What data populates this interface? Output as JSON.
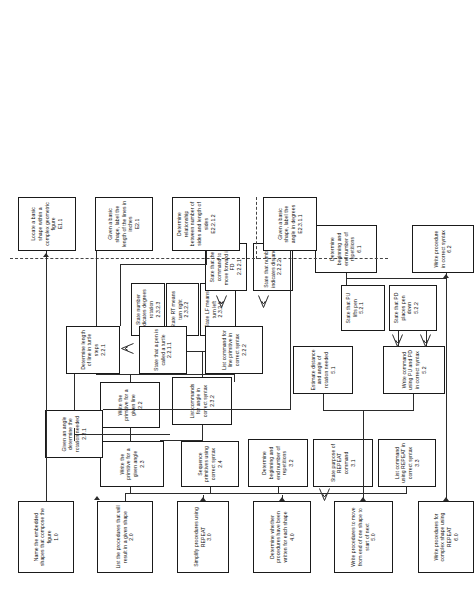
{
  "diagram": {
    "type": "hierarchical-task-analysis",
    "orientation": "rotated-90-ccw",
    "legend": {
      "entry_level_divider": "dashed line separates entry-level skills",
      "triangle_connector": "open triangle denotes subordinate verbal-information skill"
    },
    "nodes": [
      {
        "id": "1.0",
        "label": "Name the embedded shapes that compose the figure",
        "num": "1.0"
      },
      {
        "id": "2.0",
        "label": "List the procedures that will result in a given shape",
        "num": "2.0"
      },
      {
        "id": "3.0",
        "label": "Simplify procedures using REPEAT",
        "num": "3.0"
      },
      {
        "id": "4.0",
        "label": "Determine whether procedures have been written for each shape",
        "num": "4.0"
      },
      {
        "id": "5.0",
        "label": "Write procedures to move from end of one shape to start of next",
        "num": "5.0"
      },
      {
        "id": "6.0",
        "label": "Write procedures for complex shape using REPEAT",
        "num": "6.0"
      },
      {
        "id": "2.2",
        "label": "Write the primitive for a given line",
        "num": "2.2"
      },
      {
        "id": "2.2.1",
        "label": "Determine length of line in turtle steps",
        "num": "2.2.1"
      },
      {
        "id": "2.2.1.1",
        "label": "State that a pen is called a turtle",
        "num": "2.2.1.1"
      },
      {
        "id": "2.2.2",
        "label": "List command for line primitive in correct syntax",
        "num": "2.2.2"
      },
      {
        "id": "2.2.2.1",
        "label": "State that the command to move forward is FD",
        "num": "2.2.2.1"
      },
      {
        "id": "2.2.2.2",
        "label": "State that number indicates distance",
        "num": "2.2.2.2"
      },
      {
        "id": "2.3",
        "label": "Write the primitive for a given angle",
        "num": "2.3"
      },
      {
        "id": "2.3.1",
        "label": "Given an angle determine the rotation needed",
        "num": "2.3.1"
      },
      {
        "id": "2.3.2",
        "label": "List commands for angle in correct syntax",
        "num": "2.3.2"
      },
      {
        "id": "2.3.2.1",
        "label": "State LF means turn left",
        "num": "2.3.2.1"
      },
      {
        "id": "2.3.2.2",
        "label": "State RT means turn right",
        "num": "2.3.2.2"
      },
      {
        "id": "2.3.2.3",
        "label": "State number indicates degrees rotation",
        "num": "2.3.2.3"
      },
      {
        "id": "2.4",
        "label": "Sequence primitives using correct syntax",
        "num": "2.4"
      },
      {
        "id": "3.1",
        "label": "State purpose of REPEAT command",
        "num": "3.1"
      },
      {
        "id": "3.2",
        "label": "Determine beginning and end number of repetitions",
        "num": "3.2"
      },
      {
        "id": "3.3",
        "label": "List command using REPEAT in correct syntax",
        "num": "3.3"
      },
      {
        "id": "5.1",
        "label": "Estimate distance and angle of rotation needed",
        "num": "5.1"
      },
      {
        "id": "5.2",
        "label": "Write command using PU and PD in correct syntax",
        "num": "5.2"
      },
      {
        "id": "5.2.1",
        "label": "State that PU lifts pen",
        "num": "5.2.1"
      },
      {
        "id": "5.2.2",
        "label": "State that PD places pen down",
        "num": "5.2.2"
      },
      {
        "id": "6.1",
        "label": "Determine beginning and end number of repetitions",
        "num": "6.1"
      },
      {
        "id": "6.2",
        "label": "Write procedure in correct syntax",
        "num": "6.2"
      },
      {
        "id": "E1.1",
        "label": "Locate a basic shape within a complex geometric figure",
        "num": "E1.1"
      },
      {
        "id": "E2.1",
        "label": "Given a basic shape, label the length of the lines in inches",
        "num": "E2.1"
      },
      {
        "id": "E2.2.1.2",
        "label": "Determine relationship between number of sides and length of sides",
        "num": "E2.2.1.2"
      },
      {
        "id": "E2.3.1.1",
        "label": "Given a basic shape, label the angle in degrees",
        "num": "E2.3.1.1"
      }
    ]
  }
}
